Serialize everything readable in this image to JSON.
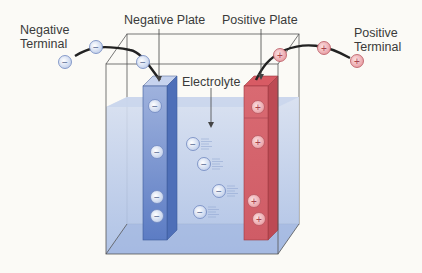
{
  "labels": {
    "negative_terminal_line1": "Negative",
    "negative_terminal_line2": "Terminal",
    "negative_plate": "Negative Plate",
    "positive_plate": "Positive Plate",
    "positive_terminal_line1": "Positive",
    "positive_terminal_line2": "Terminal",
    "electrolyte": "Electrolyte"
  },
  "symbols": {
    "negative": "−",
    "positive": "+"
  },
  "colors": {
    "negative_plate": "#5b7fc6",
    "positive_plate": "#d9676f",
    "electrolyte": "#b9c8e8",
    "wire": "#222222",
    "ion_negative": "#dbe4f4",
    "ion_positive": "#f2c3c6"
  }
}
